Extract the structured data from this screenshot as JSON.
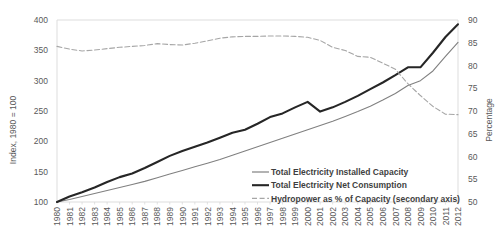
{
  "chart_data": {
    "type": "line",
    "title": "",
    "xlabel": "",
    "ylabel": "Index, 1980 = 100",
    "y2label": "Percentage",
    "ylim": [
      100,
      400
    ],
    "y2lim": [
      50,
      90
    ],
    "yticks": [
      100,
      150,
      200,
      250,
      300,
      350,
      400
    ],
    "y2ticks": [
      50,
      55,
      60,
      65,
      70,
      75,
      80,
      85,
      90
    ],
    "grid": false,
    "legend_position": "center-right-inside",
    "categories": [
      "1980",
      "1981",
      "1982",
      "1983",
      "1984",
      "1985",
      "1986",
      "1987",
      "1988",
      "1989",
      "1990",
      "1991",
      "1992",
      "1993",
      "1994",
      "1995",
      "1996",
      "1997",
      "1998",
      "1999",
      "2000",
      "2001",
      "2002",
      "2003",
      "2004",
      "2005",
      "2006",
      "2007",
      "2008",
      "2009",
      "2010",
      "2011",
      "2012"
    ],
    "series": [
      {
        "name": "Total Electricity Installed Capacity",
        "axis": "primary",
        "color": "#808080",
        "style": "solid",
        "width": 1.1,
        "values": [
          100,
          104,
          109,
          114,
          119,
          124,
          129,
          134,
          140,
          146,
          152,
          158,
          164,
          170,
          177,
          184,
          191,
          198,
          205,
          212,
          219,
          226,
          233,
          241,
          249,
          258,
          268,
          279,
          292,
          300,
          316,
          340,
          363
        ]
      },
      {
        "name": "Total Electricity Net Consumption",
        "axis": "primary",
        "color": "#262626",
        "style": "solid",
        "width": 2.1,
        "values": [
          100,
          109,
          116,
          124,
          133,
          141,
          147,
          156,
          166,
          176,
          184,
          191,
          198,
          206,
          214,
          219,
          229,
          240,
          246,
          256,
          265,
          249,
          256,
          265,
          275,
          286,
          297,
          309,
          322,
          322,
          346,
          372,
          393
        ]
      },
      {
        "name": "Hydropower as % of Capacity (secondary axis)",
        "axis": "secondary",
        "color": "#a6a6a6",
        "style": "dashed",
        "width": 1.1,
        "values": [
          84.2,
          83.6,
          83.2,
          83.4,
          83.7,
          84.0,
          84.2,
          84.4,
          84.8,
          84.6,
          84.5,
          84.9,
          85.4,
          86.0,
          86.3,
          86.4,
          86.4,
          86.5,
          86.5,
          86.4,
          86.2,
          85.5,
          84.0,
          83.3,
          82.0,
          81.8,
          80.5,
          79.2,
          76.0,
          73.4,
          71.0,
          69.3,
          69.2
        ]
      }
    ]
  },
  "legend": {
    "items": [
      {
        "label": "Total Electricity Installed Capacity",
        "color": "#808080",
        "style": "solid",
        "swatch": "line-swatch"
      },
      {
        "label": "Total Electricity Net Consumption",
        "color": "#262626",
        "style": "solid",
        "swatch": "line-swatch"
      },
      {
        "label": "Hydropower as % of Capacity (secondary axis)",
        "color": "#a6a6a6",
        "style": "dashed",
        "swatch": "dashed-line-swatch"
      }
    ]
  }
}
